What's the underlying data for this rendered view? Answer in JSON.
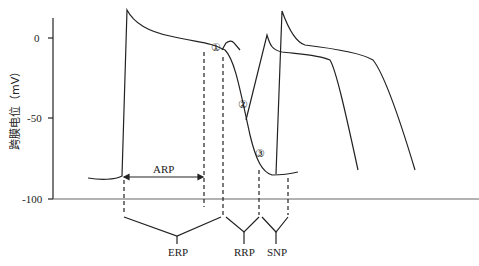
{
  "diagram": {
    "title": "",
    "y_axis": {
      "label": "跨膜电位（mV）",
      "ticks": [
        "0",
        "-50",
        "-100"
      ]
    },
    "annotations": {
      "arp": "ARP",
      "markers": [
        "①",
        "②",
        "③"
      ]
    },
    "periods": {
      "erp": "ERP",
      "rrp": "RRP",
      "snp": "SNP"
    }
  }
}
